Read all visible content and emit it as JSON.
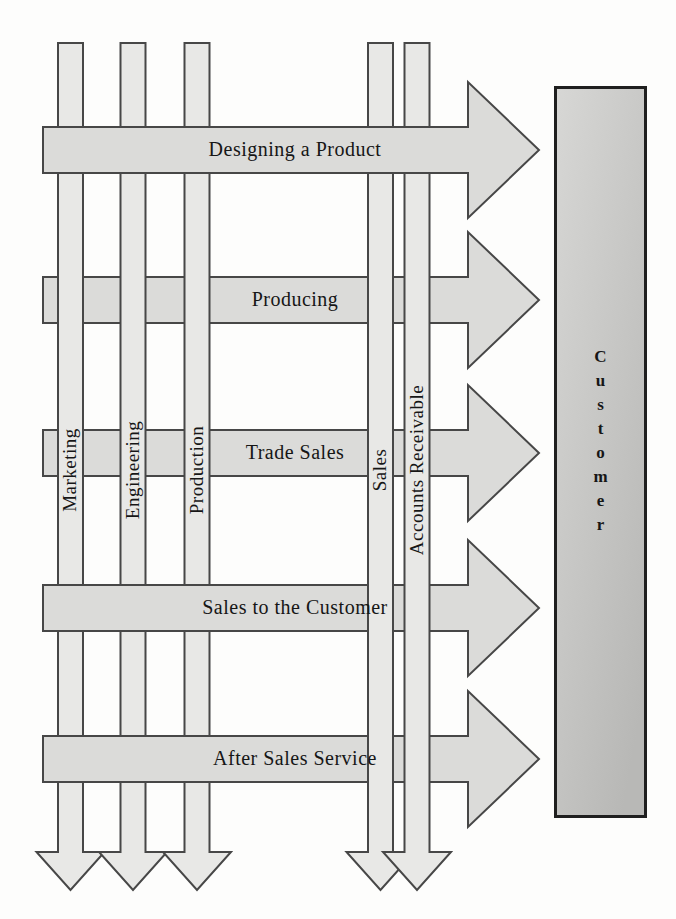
{
  "figure": {
    "processes": [
      {
        "label": "Designing a Product"
      },
      {
        "label": "Producing"
      },
      {
        "label": "Trade Sales"
      },
      {
        "label": "Sales to the Customer"
      },
      {
        "label": "After Sales Service"
      }
    ],
    "departments": [
      {
        "label": "Marketing"
      },
      {
        "label": "Engineering"
      },
      {
        "label": "Production"
      },
      {
        "label": "Sales"
      },
      {
        "label": "Accounts Receivable"
      }
    ],
    "customer": {
      "label": "Customer"
    },
    "colors": {
      "background": "#fdfdfc",
      "process_fill": "#dbdbd9",
      "department_fill": "#e8e8e6",
      "outline": "#474747",
      "text": "#161616",
      "customer_fill_light": "#d7d7d5",
      "customer_fill_dark": "#b8b8b6",
      "customer_border": "#1f1f1f"
    }
  }
}
